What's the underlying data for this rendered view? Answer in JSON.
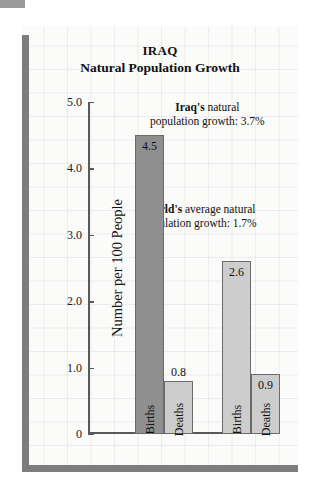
{
  "chart_data": {
    "type": "bar",
    "title": "IRAQ",
    "subtitle": "Natural Population Growth",
    "xlabel": "",
    "ylabel": "Number per 100 People",
    "ylim": [
      0,
      5.0
    ],
    "ytick_labels": [
      "5.0",
      "4.0",
      "3.0",
      "2.0",
      "1.0",
      "0"
    ],
    "ytick_values": [
      5.0,
      4.0,
      3.0,
      2.0,
      1.0,
      0
    ],
    "grid": true,
    "legend": "none",
    "groups": [
      {
        "name": "Iraq",
        "bars": [
          {
            "category": "Births",
            "value": 4.5,
            "label": "4.5",
            "color": "#8f8f8f",
            "label_position": "inside"
          },
          {
            "category": "Deaths",
            "value": 0.8,
            "label": "0.8",
            "color": "#cdcdcd",
            "label_position": "above"
          }
        ]
      },
      {
        "name": "World",
        "bars": [
          {
            "category": "Births",
            "value": 2.6,
            "label": "2.6",
            "color": "#cdcdcd",
            "label_position": "inside"
          },
          {
            "category": "Deaths",
            "value": 0.9,
            "label": "0.9",
            "color": "#cdcdcd",
            "label_position": "inside"
          }
        ]
      }
    ],
    "annotations": [
      {
        "bold": "Iraq's",
        "rest_line1": " natural",
        "line2": "population growth:  3.7%",
        "value": "3.7%"
      },
      {
        "bold": "World's",
        "rest_line1": " average natural",
        "line2": "population growth:  1.7%",
        "value": "1.7%"
      }
    ]
  },
  "colors": {
    "bar_dark": "#8f8f8f",
    "bar_light": "#cdcdcd",
    "frame": "#7d7d7d",
    "axis": "#59595b",
    "panel_background": "#fbfbfa",
    "text": "#111111"
  }
}
